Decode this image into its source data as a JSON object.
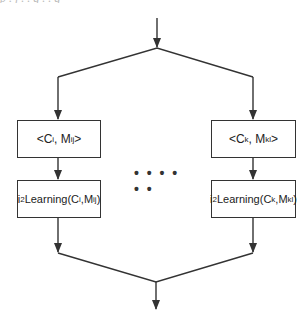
{
  "diagram": {
    "type": "flowchart",
    "top_clipped_text": "p . j  . . g . . g",
    "branches": [
      {
        "pair_box": {
          "prefix": "<C",
          "c_sub": "i",
          "mid": ", M",
          "m_sub": "ij",
          "suffix": ">"
        },
        "learning_box": {
          "prefix": "i",
          "sup": "2",
          "name": "Learning(C",
          "c_sub": "i",
          "mid": ",M",
          "m_sub": "ij",
          "suffix": ")"
        }
      },
      {
        "pair_box": {
          "prefix": "<C",
          "c_sub": "k",
          "mid": ", M",
          "m_sub": "kl",
          "suffix": ">"
        },
        "learning_box": {
          "prefix": "i",
          "sup": "2",
          "name": "Learning(C",
          "c_sub": "k",
          "mid": ",M",
          "m_sub": "kl",
          "suffix": ")"
        }
      }
    ],
    "ellipsis": "• • • • • •",
    "colors": {
      "line": "#333333",
      "text": "#222222",
      "background": "#ffffff"
    }
  }
}
